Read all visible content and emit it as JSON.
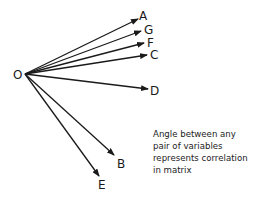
{
  "diagram": {
    "type": "vector-correlation-diagram",
    "origin": {
      "label": "O",
      "x": 25,
      "y": 74,
      "label_x": 13,
      "label_y": 69
    },
    "stroke_color": "#1a1a1a",
    "vectors": [
      {
        "label": "A",
        "tip_x": 138,
        "tip_y": 19,
        "label_x": 139,
        "label_y": 10
      },
      {
        "label": "G",
        "tip_x": 141,
        "tip_y": 31,
        "label_x": 144,
        "label_y": 24
      },
      {
        "label": "F",
        "tip_x": 144,
        "tip_y": 43,
        "label_x": 147,
        "label_y": 37
      },
      {
        "label": "C",
        "tip_x": 147,
        "tip_y": 55,
        "label_x": 150,
        "label_y": 49
      },
      {
        "label": "D",
        "tip_x": 148,
        "tip_y": 89,
        "label_x": 150,
        "label_y": 85
      },
      {
        "label": "B",
        "tip_x": 114,
        "tip_y": 155,
        "label_x": 117,
        "label_y": 158
      },
      {
        "label": "E",
        "tip_x": 99,
        "tip_y": 176,
        "label_x": 98,
        "label_y": 179
      }
    ],
    "annotation": {
      "lines": [
        "Angle between any",
        "pair of variables",
        "represents correlation",
        "in matrix"
      ]
    }
  }
}
